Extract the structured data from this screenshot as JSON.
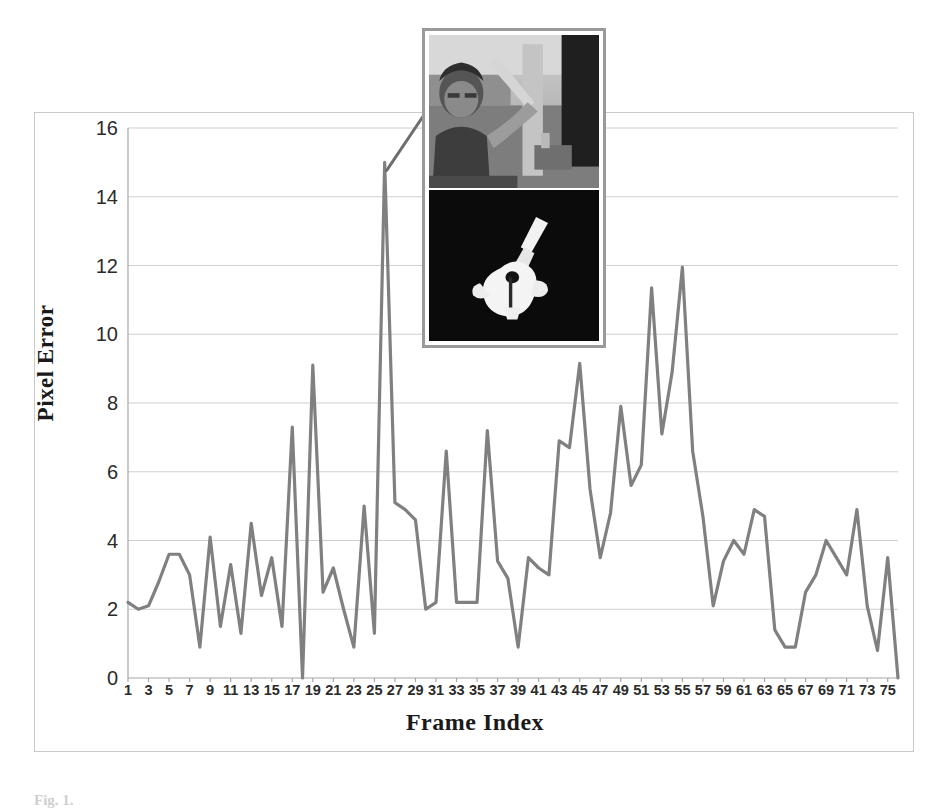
{
  "figure": {
    "caption_prefix": "Fig. 1.",
    "caption_text": ""
  },
  "chart_data": {
    "type": "line",
    "title": "",
    "xlabel": "Frame Index",
    "ylabel": "Pixel Error",
    "ylim": [
      0,
      16
    ],
    "ytick_step": 2,
    "yticks": [
      0,
      2,
      4,
      6,
      8,
      10,
      12,
      14,
      16
    ],
    "xlim": [
      1,
      76
    ],
    "xticks": [
      1,
      3,
      5,
      7,
      9,
      11,
      13,
      15,
      17,
      19,
      21,
      23,
      25,
      27,
      29,
      31,
      33,
      35,
      37,
      39,
      41,
      43,
      45,
      47,
      49,
      51,
      53,
      55,
      57,
      59,
      61,
      63,
      65,
      67,
      69,
      71,
      73,
      75
    ],
    "grid": true,
    "grid_axis": "y",
    "legend": false,
    "legend_position": "none",
    "series_color": "#808080",
    "x": [
      1,
      2,
      3,
      4,
      5,
      6,
      7,
      8,
      9,
      10,
      11,
      12,
      13,
      14,
      15,
      16,
      17,
      18,
      19,
      20,
      21,
      22,
      23,
      24,
      25,
      26,
      27,
      28,
      29,
      30,
      31,
      32,
      33,
      34,
      35,
      36,
      37,
      38,
      39,
      40,
      41,
      42,
      43,
      44,
      45,
      46,
      47,
      48,
      49,
      50,
      51,
      52,
      53,
      54,
      55,
      56,
      57,
      58,
      59,
      60,
      61,
      62,
      63,
      64,
      65,
      66,
      67,
      68,
      69,
      70,
      71,
      72,
      73,
      74,
      75,
      76
    ],
    "series": [
      {
        "name": "Pixel Error",
        "values": [
          2.2,
          2.0,
          2.1,
          2.8,
          3.6,
          3.6,
          3.0,
          0.9,
          4.1,
          1.5,
          3.3,
          1.3,
          4.5,
          2.4,
          3.5,
          1.5,
          7.3,
          0.0,
          9.1,
          2.5,
          3.2,
          2.0,
          0.9,
          5.0,
          1.3,
          15.0,
          5.1,
          4.9,
          4.6,
          2.0,
          2.2,
          6.6,
          2.2,
          2.2,
          2.2,
          7.2,
          3.4,
          2.9,
          0.9,
          3.5,
          3.2,
          3.0,
          6.9,
          6.7,
          9.15,
          5.5,
          3.5,
          4.8,
          7.9,
          5.6,
          6.2,
          11.35,
          7.1,
          8.9,
          11.95,
          6.6,
          4.7,
          2.1,
          3.4,
          4.0,
          3.6,
          4.9,
          4.7,
          1.4,
          0.9,
          0.9,
          2.5,
          3.0,
          4.0,
          3.5,
          3.0,
          4.9,
          2.1,
          0.8,
          3.5,
          0.0
        ]
      }
    ],
    "annotations": [
      {
        "name": "peak-callout",
        "at_x": 26,
        "at_y": 15.0,
        "kind": "leader-line-to-inset"
      }
    ]
  },
  "inset": {
    "name": "frame-sample-inset",
    "panels": [
      {
        "name": "camera-frame-photo",
        "description": "grayscale photo of a person holding an object"
      },
      {
        "name": "segmentation-mask",
        "description": "binary segmentation mask on black background"
      }
    ]
  }
}
